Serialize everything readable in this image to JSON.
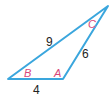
{
  "diagram": {
    "type": "triangle",
    "stroke_color": "#3aa6dd",
    "vertices": {
      "A": {
        "label": "A",
        "x": 63,
        "y": 79
      },
      "B": {
        "label": "B",
        "x": 8,
        "y": 79
      },
      "C": {
        "label": "C",
        "x": 108,
        "y": 6
      }
    },
    "sides": {
      "BC": "9",
      "AC": "6",
      "AB": "4"
    },
    "label_color": "#d9477a"
  }
}
